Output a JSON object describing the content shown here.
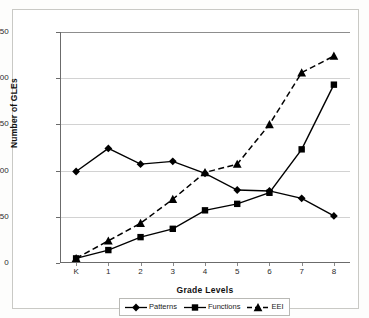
{
  "chart_data": {
    "type": "line",
    "title": "",
    "xlabel": "Grade Levels",
    "ylabel": "Number of GLEs",
    "categories": [
      "K",
      "1",
      "2",
      "3",
      "4",
      "5",
      "6",
      "7",
      "8"
    ],
    "ylim": [
      0,
      250
    ],
    "yticks": [
      0,
      50,
      100,
      150,
      200,
      250
    ],
    "grid": true,
    "legend_position": "bottom",
    "series": [
      {
        "name": "Patterns",
        "marker": "diamond",
        "linestyle": "solid",
        "color": "#000000",
        "values": [
          99,
          124,
          107,
          110,
          97,
          79,
          78,
          70,
          51
        ]
      },
      {
        "name": "Functions",
        "marker": "square",
        "linestyle": "solid",
        "color": "#000000",
        "values": [
          5,
          14,
          28,
          37,
          57,
          64,
          76,
          123,
          193
        ]
      },
      {
        "name": "EEI",
        "marker": "triangle",
        "linestyle": "dashed",
        "color": "#000000",
        "values": [
          5,
          24,
          43,
          69,
          98,
          107,
          150,
          206,
          224
        ]
      }
    ]
  },
  "axis": {
    "y_tick_labels": [
      "0",
      "50",
      "100",
      "150",
      "200",
      "250"
    ],
    "x_tick_labels": [
      "K",
      "1",
      "2",
      "3",
      "4",
      "5",
      "6",
      "7",
      "8"
    ],
    "y_title": "Number of GLEs",
    "x_title": "Grade Levels"
  },
  "legend": {
    "items": [
      {
        "label": "Patterns",
        "marker": "diamond",
        "linestyle": "solid"
      },
      {
        "label": "Functions",
        "marker": "square",
        "linestyle": "solid"
      },
      {
        "label": "EEI",
        "marker": "triangle",
        "linestyle": "dashed"
      }
    ]
  }
}
